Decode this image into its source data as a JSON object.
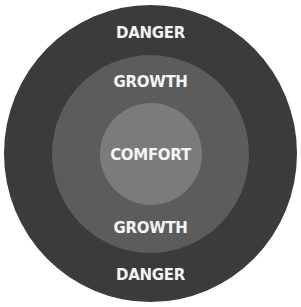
{
  "diagram": {
    "type": "concentric-circles",
    "colors": {
      "background": "#ffffff",
      "danger_zone": "#3b3b3b",
      "growth_zone": "#5c5c5c",
      "comfort_zone": "#7b7b7b",
      "text": "#f4f4f4"
    },
    "zones": [
      {
        "name": "danger",
        "labels": [
          "DANGER",
          "DANGER"
        ]
      },
      {
        "name": "growth",
        "labels": [
          "GROWTH",
          "GROWTH"
        ]
      },
      {
        "name": "comfort",
        "labels": [
          "COMFORT"
        ]
      }
    ],
    "labels": {
      "danger_top": "DANGER",
      "growth_top": "GROWTH",
      "comfort": "COMFORT",
      "growth_bottom": "GROWTH",
      "danger_bottom": "DANGER"
    }
  }
}
